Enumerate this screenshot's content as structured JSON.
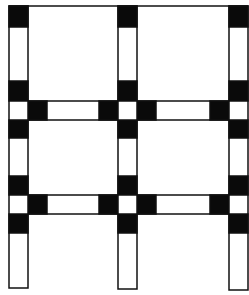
{
  "diagram": {
    "type": "structural-frame",
    "colors": {
      "stroke": "#111111",
      "fill_joint": "#0a0a0a",
      "background": "#ffffff"
    },
    "columns": [
      {
        "id": "left",
        "x": 9,
        "width": 19,
        "top": 6,
        "bottom": 288
      },
      {
        "id": "middle",
        "x": 118,
        "width": 19,
        "top": 6,
        "bottom": 289
      },
      {
        "id": "right",
        "x": 229,
        "width": 19,
        "top": 6,
        "bottom": 290
      }
    ],
    "top_beam_y": 6,
    "beam_levels": [
      {
        "id": "upper",
        "y": 101,
        "height": 19
      },
      {
        "id": "lower",
        "y": 195,
        "height": 19
      }
    ],
    "top_joints_y": [
      6,
      27
    ],
    "column_joint_blocks": [
      {
        "level": "upper",
        "above": [
          81,
          101
        ],
        "below": [
          120,
          138
        ]
      },
      {
        "level": "lower",
        "above": [
          176,
          195
        ],
        "below": [
          214,
          233
        ]
      }
    ],
    "beam_end_block_width": 19
  }
}
